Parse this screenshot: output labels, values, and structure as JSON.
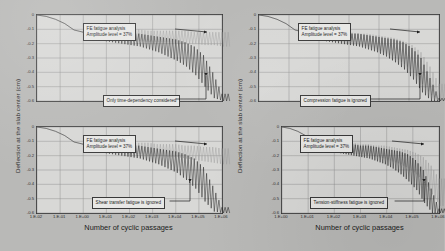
{
  "figure": {
    "axis": {
      "ylabel": "Deflection at the slab center (cm)",
      "xlabel": "Number of cyclic passages",
      "yticks": [
        "0",
        "-0.1",
        "-0.2",
        "-0.3",
        "-0.4",
        "-0.5",
        "-0.6"
      ],
      "xticks_wide": [
        "1.E-02",
        "1.E-01",
        "1.E+00",
        "1.E+01",
        "1.E+02",
        "1.E+03",
        "1.E+04",
        "1.E+05",
        "1.E+06"
      ],
      "xticks_narrow": [
        "1.E+00",
        "1.E+01",
        "1.E+02",
        "1.E+03",
        "1.E+04",
        "1.E+05",
        "1.E+06"
      ]
    },
    "common_annotation": {
      "line1": "FE fatigue analysis",
      "line2": "Amplitude level = 37%"
    },
    "panels": [
      {
        "id": "top-left",
        "reference_label": "Only time-dependency considered"
      },
      {
        "id": "top-right",
        "reference_label": "Compression fatigue is ignored"
      },
      {
        "id": "bottom-left",
        "reference_label": "Shear transfer fatigue is ignored"
      },
      {
        "id": "bottom-right",
        "reference_label": "Tension-stiffness fatigue is ignored"
      }
    ],
    "colors": {
      "fatigue_curve": "#1a1a1a",
      "reference_curve": "#9a9a9a",
      "grid": "#8d8d8d",
      "axis": "#3a3a3a",
      "plot_background": "#d8d8d6",
      "page_background": "#b9b9b7"
    }
  },
  "chart_data": {
    "type": "line",
    "title": "",
    "xlabel": "Number of cyclic passages",
    "ylabel": "Deflection at the slab center (cm)",
    "xscale": "log",
    "ylim": [
      -0.6,
      0
    ],
    "grid": true,
    "legend": "none",
    "panels": [
      {
        "id": "top-left",
        "xlim": [
          0.01,
          1000000
        ],
        "xticks": [
          "1.E-02",
          "1.E-01",
          "1.E+00",
          "1.E+01",
          "1.E+02",
          "1.E+03",
          "1.E+04",
          "1.E+05",
          "1.E+06"
        ],
        "annotation": "FE fatigue analysis / Amplitude level = 37%",
        "reference_annotation": "Only time-dependency considered",
        "series": [
          {
            "name": "FE fatigue analysis (amplitude level = 37%)",
            "color": "#1a1a1a",
            "description": "Oscillating envelope; mean deflection grows from 0 to about -0.30 cm by 1.E+05 then diverges steeply to -0.60 cm",
            "envelope_upper": [
              0.0,
              -0.01,
              -0.03,
              -0.06,
              -0.1,
              -0.12,
              -0.11,
              -0.11,
              -0.12,
              -0.12,
              -0.13,
              -0.13,
              -0.14,
              -0.15,
              -0.16,
              -0.17,
              -0.19,
              -0.22,
              -0.28,
              -0.4,
              -0.55
            ],
            "envelope_lower": [
              0.0,
              -0.01,
              -0.03,
              -0.06,
              -0.11,
              -0.15,
              -0.17,
              -0.18,
              -0.19,
              -0.2,
              -0.21,
              -0.22,
              -0.24,
              -0.26,
              -0.29,
              -0.32,
              -0.36,
              -0.42,
              -0.5,
              -0.58,
              -0.6
            ]
          },
          {
            "name": "Only time-dependency considered",
            "color": "#9a9a9a",
            "description": "Oscillating envelope saturating near -0.20 cm",
            "envelope_upper": [
              0.0,
              -0.01,
              -0.03,
              -0.06,
              -0.1,
              -0.12,
              -0.1,
              -0.1,
              -0.1,
              -0.1,
              -0.1,
              -0.1,
              -0.11,
              -0.11,
              -0.11,
              -0.11,
              -0.11,
              -0.12,
              -0.12,
              -0.12,
              -0.12
            ],
            "envelope_lower": [
              0.0,
              -0.01,
              -0.03,
              -0.06,
              -0.11,
              -0.15,
              -0.16,
              -0.17,
              -0.17,
              -0.18,
              -0.18,
              -0.18,
              -0.19,
              -0.19,
              -0.19,
              -0.2,
              -0.2,
              -0.2,
              -0.21,
              -0.21,
              -0.22
            ]
          }
        ]
      },
      {
        "id": "top-right",
        "xlim": [
          1,
          1000000
        ],
        "xticks": [
          "1.E+00",
          "1.E+01",
          "1.E+02",
          "1.E+03",
          "1.E+04",
          "1.E+05",
          "1.E+06"
        ],
        "annotation": "FE fatigue analysis / Amplitude level = 37%",
        "reference_annotation": "Compression fatigue is ignored",
        "series": [
          {
            "name": "FE fatigue analysis (amplitude level = 37%)",
            "color": "#1a1a1a",
            "description": "Diverges sharply beyond 1.E+05 reaching -0.60 cm",
            "envelope_upper": [
              0.0,
              -0.01,
              -0.03,
              -0.06,
              -0.1,
              -0.12,
              -0.11,
              -0.11,
              -0.12,
              -0.12,
              -0.13,
              -0.13,
              -0.14,
              -0.15,
              -0.16,
              -0.17,
              -0.19,
              -0.23,
              -0.3,
              -0.44,
              -0.58
            ],
            "envelope_lower": [
              0.0,
              -0.01,
              -0.03,
              -0.06,
              -0.11,
              -0.15,
              -0.17,
              -0.18,
              -0.19,
              -0.2,
              -0.21,
              -0.22,
              -0.24,
              -0.26,
              -0.29,
              -0.33,
              -0.38,
              -0.45,
              -0.54,
              -0.6,
              -0.6
            ]
          },
          {
            "name": "Compression fatigue is ignored",
            "color": "#9a9a9a",
            "description": "Nearly coincident with fatigue curve, slightly shallower, reaching about -0.45 cm",
            "envelope_upper": [
              0.0,
              -0.01,
              -0.03,
              -0.06,
              -0.1,
              -0.12,
              -0.11,
              -0.11,
              -0.11,
              -0.12,
              -0.12,
              -0.13,
              -0.13,
              -0.14,
              -0.15,
              -0.16,
              -0.18,
              -0.21,
              -0.26,
              -0.36,
              -0.48
            ],
            "envelope_lower": [
              0.0,
              -0.01,
              -0.03,
              -0.06,
              -0.11,
              -0.15,
              -0.16,
              -0.17,
              -0.18,
              -0.19,
              -0.2,
              -0.21,
              -0.22,
              -0.24,
              -0.27,
              -0.3,
              -0.34,
              -0.4,
              -0.48,
              -0.56,
              -0.6
            ]
          }
        ]
      },
      {
        "id": "bottom-left",
        "xlim": [
          0.01,
          1000000
        ],
        "xticks": [
          "1.E-02",
          "1.E-01",
          "1.E+00",
          "1.E+01",
          "1.E+02",
          "1.E+03",
          "1.E+04",
          "1.E+05",
          "1.E+06"
        ],
        "annotation": "FE fatigue analysis / Amplitude level = 37%",
        "reference_annotation": "Shear transfer fatigue is ignored",
        "series": [
          {
            "name": "FE fatigue analysis (amplitude level = 37%)",
            "color": "#1a1a1a",
            "description": "Diverges steeply after 1.E+05 to -0.60 cm",
            "envelope_upper": [
              0.0,
              -0.01,
              -0.03,
              -0.06,
              -0.1,
              -0.12,
              -0.11,
              -0.11,
              -0.12,
              -0.12,
              -0.13,
              -0.13,
              -0.14,
              -0.15,
              -0.16,
              -0.17,
              -0.19,
              -0.22,
              -0.28,
              -0.41,
              -0.56
            ],
            "envelope_lower": [
              0.0,
              -0.01,
              -0.03,
              -0.06,
              -0.11,
              -0.15,
              -0.17,
              -0.18,
              -0.19,
              -0.2,
              -0.21,
              -0.22,
              -0.24,
              -0.26,
              -0.29,
              -0.32,
              -0.37,
              -0.43,
              -0.52,
              -0.59,
              -0.6
            ]
          },
          {
            "name": "Shear transfer fatigue is ignored",
            "color": "#9a9a9a",
            "description": "Grows slowly, reaching about -0.26 cm at the end",
            "envelope_upper": [
              0.0,
              -0.01,
              -0.03,
              -0.06,
              -0.1,
              -0.12,
              -0.1,
              -0.1,
              -0.1,
              -0.11,
              -0.11,
              -0.11,
              -0.11,
              -0.12,
              -0.12,
              -0.12,
              -0.13,
              -0.13,
              -0.14,
              -0.14,
              -0.15
            ],
            "envelope_lower": [
              0.0,
              -0.01,
              -0.03,
              -0.06,
              -0.11,
              -0.15,
              -0.16,
              -0.17,
              -0.18,
              -0.18,
              -0.19,
              -0.19,
              -0.2,
              -0.2,
              -0.21,
              -0.21,
              -0.22,
              -0.23,
              -0.24,
              -0.25,
              -0.26
            ]
          }
        ]
      },
      {
        "id": "bottom-right",
        "xlim": [
          1,
          1000000
        ],
        "xticks": [
          "1.E+00",
          "1.E+01",
          "1.E+02",
          "1.E+03",
          "1.E+04",
          "1.E+05",
          "1.E+06"
        ],
        "annotation": "FE fatigue analysis / Amplitude level = 37%",
        "reference_annotation": "Tension-stiffness fatigue is ignored",
        "series": [
          {
            "name": "FE fatigue analysis (amplitude level = 37%)",
            "color": "#1a1a1a",
            "description": "Diverges beyond 1.E+05 to -0.60 cm",
            "envelope_upper": [
              0.0,
              -0.01,
              -0.03,
              -0.06,
              -0.1,
              -0.12,
              -0.11,
              -0.11,
              -0.12,
              -0.12,
              -0.13,
              -0.13,
              -0.14,
              -0.15,
              -0.16,
              -0.17,
              -0.19,
              -0.23,
              -0.3,
              -0.43,
              -0.57
            ],
            "envelope_lower": [
              0.0,
              -0.01,
              -0.03,
              -0.06,
              -0.11,
              -0.15,
              -0.17,
              -0.18,
              -0.19,
              -0.2,
              -0.21,
              -0.22,
              -0.24,
              -0.26,
              -0.29,
              -0.33,
              -0.38,
              -0.44,
              -0.53,
              -0.6,
              -0.6
            ]
          },
          {
            "name": "Tension-stiffness fatigue is ignored",
            "color": "#9a9a9a",
            "description": "Shallower growth reaching about -0.40 cm",
            "envelope_upper": [
              0.0,
              -0.01,
              -0.03,
              -0.06,
              -0.1,
              -0.12,
              -0.11,
              -0.11,
              -0.11,
              -0.11,
              -0.12,
              -0.12,
              -0.13,
              -0.13,
              -0.14,
              -0.15,
              -0.16,
              -0.18,
              -0.21,
              -0.27,
              -0.36
            ],
            "envelope_lower": [
              0.0,
              -0.01,
              -0.03,
              -0.06,
              -0.11,
              -0.15,
              -0.16,
              -0.17,
              -0.18,
              -0.19,
              -0.19,
              -0.2,
              -0.21,
              -0.22,
              -0.24,
              -0.26,
              -0.29,
              -0.33,
              -0.39,
              -0.47,
              -0.55
            ]
          }
        ]
      }
    ]
  }
}
